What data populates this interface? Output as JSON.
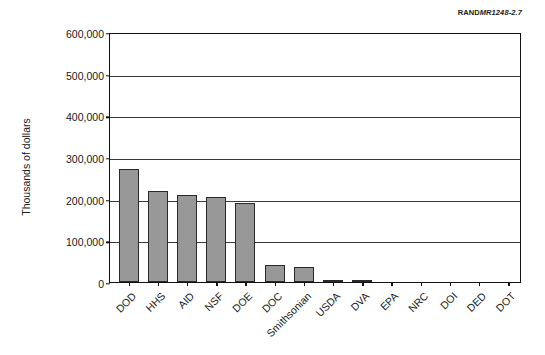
{
  "figure": {
    "source_tag_brand": "RAND",
    "source_tag_id": "MR1248-2.7"
  },
  "chart_data": {
    "type": "bar",
    "title": "",
    "xlabel": "",
    "ylabel": "Thousands of dollars",
    "ylim": [
      0,
      600000
    ],
    "ytick_labels": [
      "600,000",
      "500,000",
      "400,000",
      "300,000",
      "200,000",
      "100,000",
      "0"
    ],
    "ytick_values": [
      600000,
      500000,
      400000,
      300000,
      200000,
      100000,
      0
    ],
    "grid": true,
    "legend": false,
    "categories": [
      "DOD",
      "HHS",
      "AID",
      "NSF",
      "DOE",
      "DOC",
      "Smithsonian",
      "USDA",
      "DVA",
      "EPA",
      "NRC",
      "DOI",
      "DED",
      "DOT"
    ],
    "values": [
      271000,
      218000,
      210000,
      203000,
      190000,
      40000,
      35000,
      6000,
      5000,
      1000,
      700,
      500,
      400,
      300
    ],
    "bar_color": "#989898",
    "bar_edge_color": "#2a2a2a"
  }
}
